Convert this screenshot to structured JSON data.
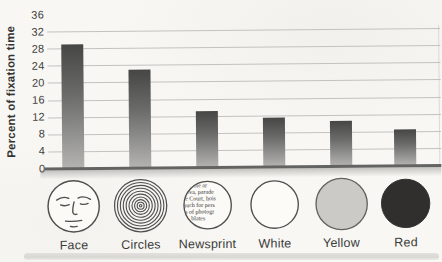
{
  "chart_data": {
    "type": "bar",
    "title": "",
    "xlabel": "",
    "ylabel": "Percent of fixation time",
    "categories": [
      "Face",
      "Circles",
      "Newsprint",
      "White",
      "Yellow",
      "Red"
    ],
    "values": [
      29,
      23,
      13,
      11.5,
      10.5,
      8.5
    ],
    "ylim": [
      0,
      36
    ],
    "yticks": [
      0,
      4,
      8,
      12,
      16,
      20,
      24,
      28,
      32,
      36
    ],
    "grid": true,
    "legend": "none",
    "bar_style": {
      "gradient_top": "#464645",
      "gradient_bottom": "#b4b3b0",
      "width_px": 22
    }
  },
  "axis": {
    "ylabel": "Percent of fixation time",
    "tick_labels": [
      "36",
      "32",
      "28",
      "24",
      "20",
      "16",
      "12",
      "8",
      "4",
      "0"
    ]
  },
  "stimuli": [
    {
      "icon": "face-icon",
      "label": "Face"
    },
    {
      "icon": "concentric-circles-icon",
      "label": "Circles"
    },
    {
      "icon": "newsprint-icon",
      "label": "Newsprint",
      "lines": [
        "rtable ar",
        "llova, parade",
        "tre Court, hois",
        "much for pers",
        "ts of photogr",
        "blates"
      ]
    },
    {
      "icon": "white-disc-icon",
      "label": "White"
    },
    {
      "icon": "yellow-disc-icon",
      "label": "Yellow"
    },
    {
      "icon": "red-disc-icon",
      "label": "Red"
    }
  ],
  "colors": {
    "paper": "#f8f7f4",
    "grid_line": "#c3c2bf",
    "baseline": "#636361",
    "bar_gradient_top": "#464645",
    "bar_gradient_bottom": "#b4b3b0",
    "text": "#3b3b39",
    "yellow_disc_fill": "#cbcac6",
    "red_disc_fill": "#312f2e",
    "icon_stroke": "#4f4f4d"
  }
}
